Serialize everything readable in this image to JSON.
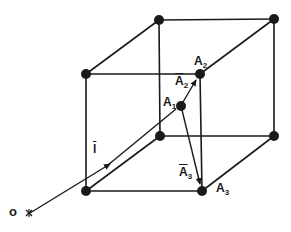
{
  "diagram": {
    "type": "cubic lattice with position vectors",
    "stroke_color": "#1a1a1a",
    "background": "#ffffff",
    "nodes": [
      {
        "id": "back-top-left",
        "x": 159,
        "y": 20
      },
      {
        "id": "back-top-right",
        "x": 274,
        "y": 19
      },
      {
        "id": "front-top-left",
        "x": 86,
        "y": 74
      },
      {
        "id": "front-top-right",
        "x": 200,
        "y": 74
      },
      {
        "id": "back-bottom-left",
        "x": 160,
        "y": 136
      },
      {
        "id": "back-bottom-right",
        "x": 274,
        "y": 136
      },
      {
        "id": "front-bottom-left",
        "x": 86,
        "y": 191
      },
      {
        "id": "front-bottom-right",
        "x": 202,
        "y": 191
      },
      {
        "id": "A1",
        "x": 181,
        "y": 106
      }
    ],
    "labels": {
      "origin": "o",
      "l_vector": "l",
      "A1_base": "A",
      "A1_sub": "1",
      "A2_base": "A",
      "A2_sub": "2",
      "A2_vec_base": "A",
      "A2_vec_sub": "2",
      "A3_base": "A",
      "A3_sub": "3",
      "A3_vec_base": "A",
      "A3_vec_sub": "3"
    },
    "vectors": [
      {
        "name": "l",
        "from": "O",
        "to": "A1"
      },
      {
        "name": "A2",
        "from": "A1",
        "to": "front-top-right"
      },
      {
        "name": "A3",
        "from": "A1",
        "to": "front-bottom-right"
      }
    ]
  }
}
